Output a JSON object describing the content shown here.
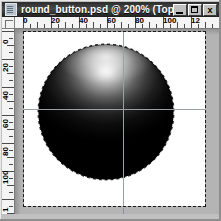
{
  "window": {
    "title": "round_button.psd @ 200% (Top R...",
    "document_name": "round_button.psd",
    "zoom_level": "200%",
    "layer_hint": "Top R...",
    "icon": "psd-document-icon",
    "controls": {
      "minimize_label": "_",
      "minimize_name": "minimize-icon",
      "maximize_label": "",
      "maximize_name": "maximize-icon",
      "close_label": "x",
      "close_name": "close-icon"
    },
    "colors": {
      "titlebar_active": "#2b2b2b",
      "titlebar_text": "#ffffff",
      "chrome": "#c0c0c0",
      "workarea": "#b4b4b4",
      "canvas": "#ffffff",
      "ruler": "#f4f4f4",
      "guide": "#9aa0a6",
      "marquee": "#ffffff"
    }
  },
  "rulers": {
    "unit": "pixels",
    "horizontal": {
      "labels": [
        "0",
        "20",
        "40",
        "60",
        "80",
        "100",
        "12"
      ],
      "label_positions": [
        6,
        34,
        62,
        90,
        118,
        146,
        174
      ],
      "origin_px": 8,
      "px_per_unit": 1.4
    },
    "vertical": {
      "labels": [
        "0",
        "20",
        "40",
        "60",
        "80",
        "100",
        "1"
      ],
      "label_positions": [
        4,
        32,
        60,
        88,
        116,
        144,
        172
      ],
      "origin_px": 2,
      "px_per_unit": 1.4
    }
  },
  "canvas": {
    "guides": {
      "horizontal": [
        77
      ],
      "vertical": [
        99
      ]
    },
    "selection": {
      "type": "elliptical-marquee",
      "state": "active",
      "style": "marching-ants"
    },
    "artwork": {
      "name": "round-button-sphere",
      "shape": "circle",
      "center_x": 82,
      "center_y": 80,
      "radius": 68,
      "gradient_type": "radial",
      "highlight_position": "top-center",
      "highlight_color": "#f6f6f6",
      "shadow_color": "#000000"
    }
  },
  "statusbar": {
    "text": ""
  }
}
